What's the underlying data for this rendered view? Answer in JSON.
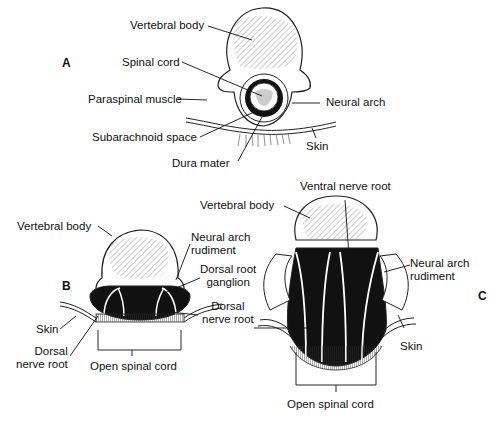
{
  "figure": {
    "panels": [
      {
        "id": "A",
        "labels": {
          "vertebral_body": "Vertebral body",
          "spinal_cord": "Spinal cord",
          "paraspinal_muscle": "Paraspinal muscle",
          "neural_arch": "Neural arch",
          "subarachnoid_space": "Subarachnoid space",
          "skin": "Skin",
          "dura_mater": "Dura mater"
        }
      },
      {
        "id": "B",
        "labels": {
          "vertebral_body": "Vertebral body",
          "neural_arch_rudiment_1": "Neural arch",
          "neural_arch_rudiment_2": "rudiment",
          "dorsal_root_ganglion_1": "Dorsal root",
          "dorsal_root_ganglion_2": "ganglion",
          "dorsal_nerve_root_right_1": "Dorsal",
          "dorsal_nerve_root_right_2": "nerve root",
          "skin": "Skin",
          "dorsal_nerve_root_left_1": "Dorsal",
          "dorsal_nerve_root_left_2": "nerve root",
          "open_spinal_cord": "Open spinal cord"
        }
      },
      {
        "id": "C",
        "labels": {
          "ventral_nerve_root": "Ventral nerve root",
          "vertebral_body": "Vertebral body",
          "neural_arch_rudiment_1": "Neural arch",
          "neural_arch_rudiment_2": "rudiment",
          "skin": "Skin",
          "open_spinal_cord": "Open spinal cord"
        }
      }
    ]
  }
}
